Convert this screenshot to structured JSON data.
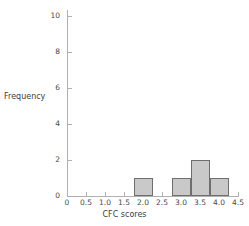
{
  "chart_data": {
    "type": "bar",
    "title": "",
    "xlabel": "CFC scores",
    "ylabel": "Frequency",
    "xlim": [
      0,
      4.5
    ],
    "ylim": [
      0,
      10.6
    ],
    "grid": false,
    "legend": null,
    "bin_width": 0.5,
    "categories": [
      "1.75-2.25",
      "2.75-3.25",
      "3.25-3.75",
      "3.75-4.25"
    ],
    "values": [
      1,
      1,
      2,
      1
    ],
    "bars": [
      {
        "start": 1.75,
        "end": 2.25,
        "value": 1
      },
      {
        "start": 2.75,
        "end": 3.25,
        "value": 1
      },
      {
        "start": 3.25,
        "end": 3.75,
        "value": 2
      },
      {
        "start": 3.75,
        "end": 4.25,
        "value": 1
      }
    ],
    "x_ticks": [
      0,
      0.5,
      1.0,
      1.5,
      2.0,
      2.5,
      3.0,
      3.5,
      4.0,
      4.5
    ],
    "x_tick_labels": [
      "0",
      "0.5",
      "1.0",
      "1.5",
      "2.0",
      "2.5",
      "3.0",
      "3.5",
      "4.0",
      "4.5"
    ],
    "y_ticks": [
      0,
      2,
      4,
      6,
      8,
      10
    ],
    "y_tick_labels": [
      "0",
      "2",
      "4",
      "6",
      "8",
      "10"
    ],
    "colors": {
      "bar_fill": "#c9c9c9",
      "bar_edge": "#6e6e6e",
      "axis": "#b0b0b0",
      "text": "#4a4a4a",
      "background": "#ffffff"
    }
  }
}
